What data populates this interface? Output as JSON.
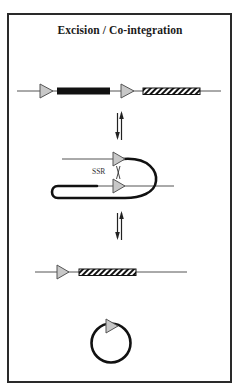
{
  "title": "Excision / Co-integration",
  "labels": {
    "recombinase": "SSR"
  },
  "colors": {
    "line": "#555555",
    "thick_line": "#111111",
    "site_fill": "#c8c8c8",
    "site_stroke": "#555555",
    "black_bar": "#111111",
    "hatch": "#111111",
    "frame": "#2a2a2a"
  },
  "steps": [
    {
      "name": "integrated-construct",
      "elements": [
        "recombination-site",
        "black-gene-segment",
        "recombination-site",
        "hatched-gene-segment"
      ]
    },
    {
      "name": "synapsis-intermediate",
      "elements": [
        "recombination-site",
        "recombination-site",
        "loop"
      ],
      "label": "SSR"
    },
    {
      "name": "excised-locus",
      "elements": [
        "recombination-site",
        "hatched-gene-segment"
      ]
    },
    {
      "name": "circular-product",
      "elements": [
        "circle",
        "recombination-site"
      ]
    }
  ],
  "transitions": [
    "reversible",
    "reversible"
  ]
}
